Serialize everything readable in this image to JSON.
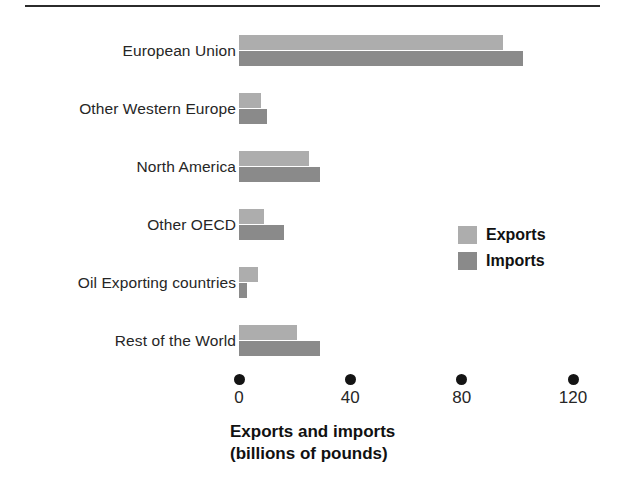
{
  "figure": {
    "background": "#ffffff",
    "rule_color": "#2b2b2b"
  },
  "chart_data": {
    "type": "bar",
    "orientation": "horizontal",
    "title": "",
    "subtitle": "",
    "xlabel": "Exports and imports (billions of pounds)",
    "xlabel_line1": "Exports and imports",
    "xlabel_line2": "(billions of pounds)",
    "ylabel": "",
    "categories": [
      "European Union",
      "Other Western Europe",
      "North America",
      "Other OECD",
      "Oil Exporting countries",
      "Rest of the World"
    ],
    "series": [
      {
        "name": "Exports",
        "color": "#adadad",
        "values": [
          95,
          8,
          25,
          9,
          7,
          21
        ]
      },
      {
        "name": "Imports",
        "color": "#8a8a8a",
        "values": [
          102,
          10,
          29,
          16,
          3,
          29
        ]
      }
    ],
    "xlim": [
      0,
      120
    ],
    "xticks": [
      0,
      40,
      80,
      120
    ],
    "xtick_labels": [
      "0",
      "40",
      "80",
      "120"
    ],
    "grid": false,
    "legend_position": "middle-right",
    "legend": [
      {
        "label": "Exports",
        "color": "#adadad"
      },
      {
        "label": "Imports",
        "color": "#8a8a8a"
      }
    ],
    "tick_marker": "filled-circle"
  }
}
